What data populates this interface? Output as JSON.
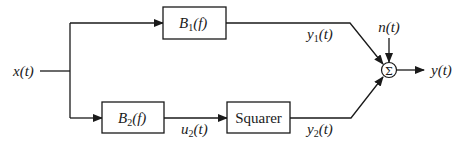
{
  "diagram": {
    "type": "block-diagram",
    "input": {
      "label": "x(t)"
    },
    "blocks": [
      {
        "id": "B1",
        "name": "B",
        "subscript": "1",
        "arg": "(f)"
      },
      {
        "id": "B2",
        "name": "B",
        "subscript": "2",
        "arg": "(f)"
      },
      {
        "id": "squarer",
        "label": "Squarer"
      }
    ],
    "signals": {
      "y1": {
        "name": "y",
        "subscript": "1",
        "arg": "(t)"
      },
      "u2": {
        "name": "u",
        "subscript": "2",
        "arg": "(t)"
      },
      "y2": {
        "name": "y",
        "subscript": "2",
        "arg": "(t)"
      },
      "noise": {
        "label": "n(t)"
      },
      "output": {
        "label": "y(t)"
      }
    },
    "summer": {
      "symbol": "Σ"
    },
    "connections": [
      [
        "x(t)",
        "B1"
      ],
      [
        "x(t)",
        "B2"
      ],
      [
        "B2",
        "squarer"
      ],
      [
        "B1",
        "Σ"
      ],
      [
        "squarer",
        "Σ"
      ],
      [
        "n(t)",
        "Σ"
      ],
      [
        "Σ",
        "y(t)"
      ]
    ]
  }
}
